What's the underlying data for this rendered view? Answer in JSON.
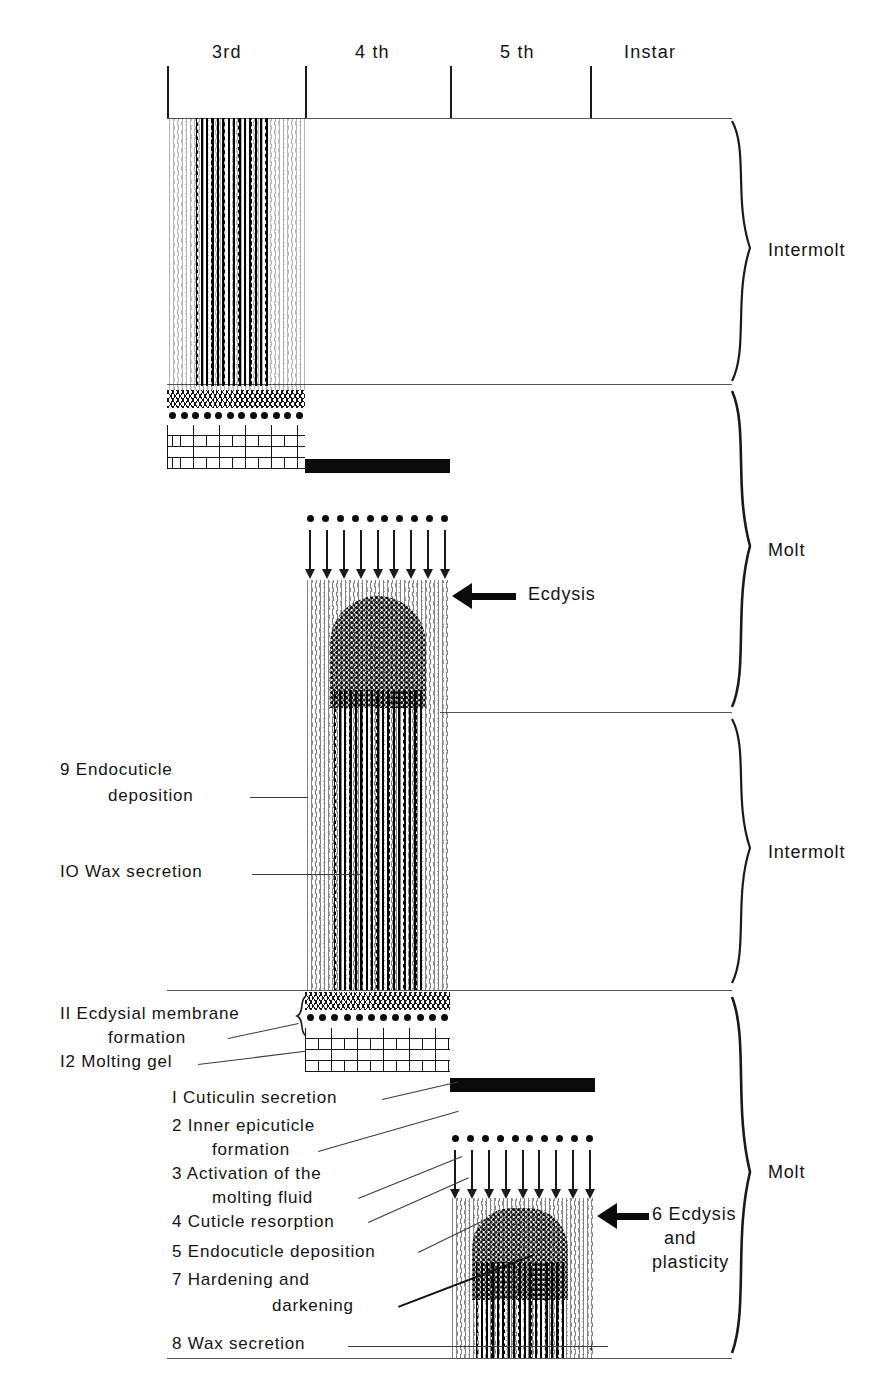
{
  "figure": {
    "running_head": "",
    "type": "cuticle-deposition-timeline-diagram"
  },
  "axis": {
    "label_suffix": "Instar",
    "instars": [
      {
        "id": "3rd",
        "label": "3rd"
      },
      {
        "id": "4th",
        "label": "4 th"
      },
      {
        "id": "5th",
        "label": "5 th"
      },
      {
        "id": "inst",
        "label": "Instar"
      }
    ]
  },
  "phases": [
    {
      "id": "phase-1",
      "label": "Intermolt"
    },
    {
      "id": "phase-2",
      "label": "Molt"
    },
    {
      "id": "phase-3",
      "label": "Intermolt"
    },
    {
      "id": "phase-4",
      "label": "Molt"
    }
  ],
  "callouts": {
    "ecdysis_upper": "Ecdysis",
    "ecdysis_lower_line1": "6 Ecdysis",
    "ecdysis_lower_line2": "and",
    "ecdysis_lower_line3": "plasticity"
  },
  "left_labels": [
    {
      "n": "9",
      "line1": "9 Endocuticle",
      "line2": "deposition"
    },
    {
      "n": "10",
      "line1": "IO Wax secretion",
      "line2": ""
    },
    {
      "n": "11",
      "line1": "II Ecdysial membrane",
      "line2": "formation"
    },
    {
      "n": "12",
      "line1": "I2 Molting gel",
      "line2": ""
    }
  ],
  "numbered_steps": [
    {
      "n": "1",
      "line1": "I Cuticulin secretion",
      "line2": ""
    },
    {
      "n": "2",
      "line1": "2 Inner epicuticle",
      "line2": "formation"
    },
    {
      "n": "3",
      "line1": "3 Activation of the",
      "line2": "molting fluid"
    },
    {
      "n": "4",
      "line1": "4 Cuticle resorption",
      "line2": ""
    },
    {
      "n": "5",
      "line1": "5 Endocuticle deposition",
      "line2": ""
    },
    {
      "n": "7",
      "line1": "7 Hardening and",
      "line2": "darkening"
    },
    {
      "n": "8",
      "line1": "8 Wax secretion",
      "line2": ""
    }
  ],
  "colors": {
    "ink": "#111111",
    "rule": "#555555",
    "cuticulin": "#0a0a0a",
    "paper": "#ffffff"
  }
}
